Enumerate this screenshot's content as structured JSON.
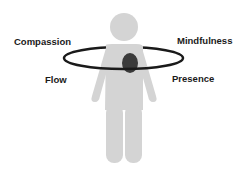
{
  "diagram": {
    "labels": {
      "top_left": "Compassion",
      "top_right": "Mindfulness",
      "bottom_left": "Flow",
      "bottom_right": "Presence"
    },
    "colors": {
      "figure": "#d4d4d4",
      "ring": "#1a1a1a",
      "heart": "#3a3a3a",
      "text": "#1a1a1a"
    }
  }
}
